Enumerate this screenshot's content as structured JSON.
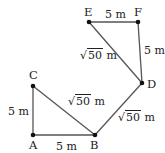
{
  "figure": {
    "points": [
      {
        "name": "A",
        "x": 33,
        "y": 135
      },
      {
        "name": "B",
        "x": 95,
        "y": 135
      },
      {
        "name": "C",
        "x": 33,
        "y": 86
      },
      {
        "name": "D",
        "x": 142,
        "y": 83
      },
      {
        "name": "E",
        "x": 89,
        "y": 22
      },
      {
        "name": "F",
        "x": 138,
        "y": 22
      }
    ],
    "segments": [
      {
        "from": "A",
        "to": "B",
        "length": "5 m"
      },
      {
        "from": "A",
        "to": "C",
        "length": "5 m"
      },
      {
        "from": "C",
        "to": "B",
        "length": "√50 m"
      },
      {
        "from": "B",
        "to": "D",
        "length": "√50 m"
      },
      {
        "from": "D",
        "to": "E",
        "length": "√50 m"
      },
      {
        "from": "E",
        "to": "F",
        "length": "5 m"
      },
      {
        "from": "F",
        "to": "D",
        "length": "5 m"
      }
    ],
    "labels": {
      "A": "A",
      "B": "B",
      "C": "C",
      "D": "D",
      "E": "E",
      "F": "F",
      "ab": "5 m",
      "ac": "5 m",
      "ef": "5 m",
      "fd": "5 m",
      "radicand": "50",
      "unit": " m",
      "sqrt_sign": "√"
    },
    "colors": {
      "line": "#555555",
      "point": "#111111",
      "text": "#222222"
    }
  }
}
